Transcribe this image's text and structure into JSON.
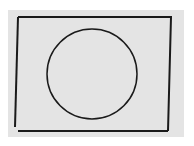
{
  "diagram": {
    "type": "venn-like-shape",
    "background": {
      "color": "#e4e4e4",
      "x": 8,
      "y": 10,
      "width": 176,
      "height": 127
    },
    "rectangle": {
      "points": [
        [
          18,
          17
        ],
        [
          171,
          17
        ],
        [
          168,
          131
        ],
        [
          15,
          127
        ]
      ],
      "stroke": "#1a1a1a",
      "stroke_width": 2
    },
    "circle": {
      "cx": 92,
      "cy": 74,
      "r": 45,
      "stroke": "#1a1a1a",
      "stroke_width": 1.5
    },
    "labels": []
  }
}
